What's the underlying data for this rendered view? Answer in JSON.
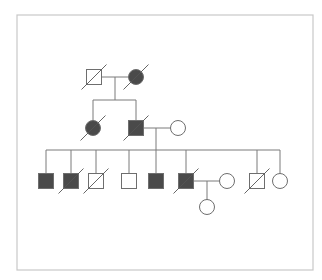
{
  "diagram": {
    "type": "pedigree",
    "colors": {
      "affected_fill": "#4a4a4a",
      "unaffected_fill": "#ffffff",
      "outline": "#6e6e6e",
      "line": "#7a7a7a",
      "border": "#c8c8c8"
    },
    "frame": {
      "x": 17,
      "y": 15,
      "w": 296,
      "h": 255
    },
    "size": 15,
    "individuals": [
      {
        "id": "I-1",
        "generation": 1,
        "sex": "male",
        "affected": false,
        "deceased": true,
        "cx": 94,
        "cy": 77
      },
      {
        "id": "I-2",
        "generation": 1,
        "sex": "female",
        "affected": true,
        "deceased": true,
        "cx": 136,
        "cy": 77
      },
      {
        "id": "II-1",
        "generation": 2,
        "sex": "female",
        "affected": true,
        "deceased": true,
        "cx": 93,
        "cy": 128
      },
      {
        "id": "II-2",
        "generation": 2,
        "sex": "male",
        "affected": true,
        "deceased": true,
        "cx": 136,
        "cy": 128
      },
      {
        "id": "II-3",
        "generation": 2,
        "sex": "female",
        "affected": false,
        "deceased": false,
        "cx": 178,
        "cy": 128
      },
      {
        "id": "III-1",
        "generation": 3,
        "sex": "male",
        "affected": true,
        "deceased": false,
        "cx": 46,
        "cy": 181
      },
      {
        "id": "III-2",
        "generation": 3,
        "sex": "male",
        "affected": true,
        "deceased": true,
        "cx": 71,
        "cy": 181
      },
      {
        "id": "III-3",
        "generation": 3,
        "sex": "male",
        "affected": false,
        "deceased": true,
        "cx": 96,
        "cy": 181
      },
      {
        "id": "III-4",
        "generation": 3,
        "sex": "male",
        "affected": false,
        "deceased": false,
        "cx": 129,
        "cy": 181
      },
      {
        "id": "III-5",
        "generation": 3,
        "sex": "male",
        "affected": true,
        "deceased": false,
        "cx": 156,
        "cy": 181
      },
      {
        "id": "III-6",
        "generation": 3,
        "sex": "male",
        "affected": true,
        "deceased": true,
        "cx": 186,
        "cy": 181
      },
      {
        "id": "III-7",
        "generation": 3,
        "sex": "female",
        "affected": false,
        "deceased": false,
        "cx": 227,
        "cy": 181
      },
      {
        "id": "III-8",
        "generation": 3,
        "sex": "male",
        "affected": false,
        "deceased": true,
        "cx": 257,
        "cy": 181
      },
      {
        "id": "III-9",
        "generation": 3,
        "sex": "female",
        "affected": false,
        "deceased": false,
        "cx": 280,
        "cy": 181
      },
      {
        "id": "IV-1",
        "generation": 4,
        "sex": "female",
        "affected": false,
        "deceased": false,
        "cx": 207,
        "cy": 207
      }
    ],
    "lines": [
      {
        "name": "couple-line-gen1",
        "x1": 101,
        "y1": 77,
        "x2": 129,
        "y2": 77
      },
      {
        "name": "descent-line-gen1",
        "x1": 115,
        "y1": 77,
        "x2": 115,
        "y2": 100
      },
      {
        "name": "sibship-line-gen2",
        "x1": 93,
        "y1": 100,
        "x2": 136,
        "y2": 100
      },
      {
        "name": "drop-II-1",
        "x1": 93,
        "y1": 100,
        "x2": 93,
        "y2": 121
      },
      {
        "name": "drop-II-2",
        "x1": 136,
        "y1": 100,
        "x2": 136,
        "y2": 121
      },
      {
        "name": "couple-line-gen2",
        "x1": 143,
        "y1": 128,
        "x2": 171,
        "y2": 128
      },
      {
        "name": "descent-line-gen2",
        "x1": 156,
        "y1": 128,
        "x2": 156,
        "y2": 150
      },
      {
        "name": "sibship-line-gen3",
        "x1": 46,
        "y1": 150,
        "x2": 280,
        "y2": 150
      },
      {
        "name": "drop-III-1",
        "x1": 46,
        "y1": 150,
        "x2": 46,
        "y2": 174
      },
      {
        "name": "drop-III-2",
        "x1": 71,
        "y1": 150,
        "x2": 71,
        "y2": 174
      },
      {
        "name": "drop-III-3",
        "x1": 96,
        "y1": 150,
        "x2": 96,
        "y2": 174
      },
      {
        "name": "drop-III-4",
        "x1": 129,
        "y1": 150,
        "x2": 129,
        "y2": 174
      },
      {
        "name": "drop-III-5",
        "x1": 156,
        "y1": 150,
        "x2": 156,
        "y2": 174
      },
      {
        "name": "drop-III-6",
        "x1": 186,
        "y1": 150,
        "x2": 186,
        "y2": 174
      },
      {
        "name": "drop-III-8",
        "x1": 257,
        "y1": 150,
        "x2": 257,
        "y2": 174
      },
      {
        "name": "drop-III-9",
        "x1": 280,
        "y1": 150,
        "x2": 280,
        "y2": 174
      },
      {
        "name": "couple-line-gen3",
        "x1": 193,
        "y1": 181,
        "x2": 220,
        "y2": 181
      },
      {
        "name": "descent-line-gen3",
        "x1": 207,
        "y1": 181,
        "x2": 207,
        "y2": 200
      }
    ]
  }
}
